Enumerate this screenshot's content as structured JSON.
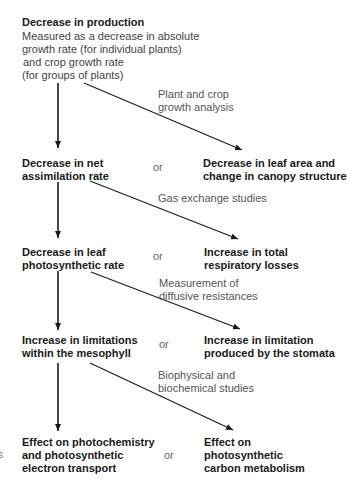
{
  "diagram": {
    "top_node": {
      "title": "Decrease in production",
      "lines": [
        "Measured as a decrease in absolute",
        "growth rate (for individual plants)",
        "and crop growth rate",
        "(for groups of plants)"
      ]
    },
    "levels": [
      {
        "left": [
          "Decrease in net",
          "assimilation rate"
        ],
        "connector": "or",
        "right": [
          "Decrease in leaf area and",
          "change in canopy structure"
        ],
        "method": [
          "Plant and crop",
          "growth analysis"
        ]
      },
      {
        "left": [
          "Decrease in leaf",
          "photosynthetic rate"
        ],
        "connector": "or",
        "right": [
          "Increase in total",
          "respiratory losses"
        ],
        "method": [
          "Gas exchange studies"
        ]
      },
      {
        "left": [
          "Increase in limitations",
          "within the mesophyll"
        ],
        "connector": "or",
        "right": [
          "Increase in limitation",
          "produced by the stomata"
        ],
        "method": [
          "Measurement of",
          "diffusive resistances"
        ]
      },
      {
        "left": [
          "Effect on photochemistry",
          "and photosynthetic",
          "electron transport"
        ],
        "connector": "or",
        "right": [
          "Effect on",
          "photosynthetic",
          "carbon metabolism"
        ],
        "method": [
          "Biophysical and",
          "biochemical studies"
        ]
      }
    ],
    "edge_fragment": "s",
    "colors": {
      "arrow": "#1a1a1a",
      "bold_text": "#1a1a1a",
      "body_text": "#444444"
    }
  }
}
